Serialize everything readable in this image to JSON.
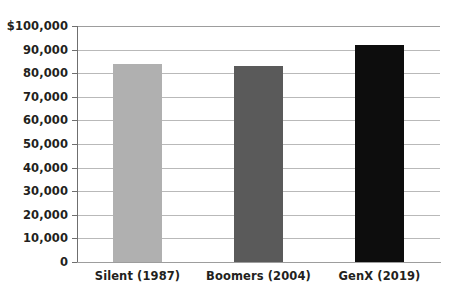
{
  "chart_data": {
    "type": "bar",
    "title": "",
    "subtitle": "",
    "xlabel": "",
    "ylabel": "",
    "categories": [
      "Silent (1987)",
      "Boomers (2004)",
      "GenX (2019)"
    ],
    "values": [
      84000,
      83000,
      92000
    ],
    "series": [
      {
        "name": "Median value",
        "values": [
          84000,
          83000,
          92000
        ],
        "colors": [
          "#b0b0b0",
          "#5a5a5a",
          "#0d0d0d"
        ]
      }
    ],
    "ylim": [
      0,
      100000
    ],
    "ytick_values": [
      0,
      10000,
      20000,
      30000,
      40000,
      50000,
      60000,
      70000,
      80000,
      90000,
      100000
    ],
    "ytick_labels": [
      "0",
      "10,000",
      "20,000",
      "30,000",
      "40,000",
      "50,000",
      "60,000",
      "70,000",
      "80,000",
      "90,000",
      "$100,000"
    ],
    "grid": "horizontal",
    "legend": "none",
    "annotations": []
  },
  "colors": {
    "background": "#ffffff",
    "gridline": "#b9b9b9",
    "axis": "#6f6f6f",
    "text": "#231f20",
    "bar_1": "#b0b0b0",
    "bar_2": "#5a5a5a",
    "bar_3": "#0d0d0d"
  }
}
